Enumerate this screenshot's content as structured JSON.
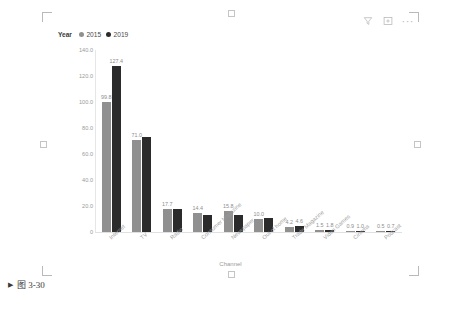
{
  "caption": {
    "marker": "▶",
    "text": "图 3-30"
  },
  "visual_header": {
    "filter_icon": "filter-funnel-icon",
    "focus_icon": "focus-mode-icon",
    "more_options": "···"
  },
  "legend": {
    "title": "Year",
    "items": [
      {
        "label": "2015",
        "color": "#909090"
      },
      {
        "label": "2019",
        "color": "#2b2b2b"
      }
    ]
  },
  "chart_data": {
    "type": "bar",
    "title": "",
    "xlabel": "Channel",
    "ylabel": "",
    "ylim": [
      0,
      140
    ],
    "yticks": [
      "0",
      "20.0",
      "40.0",
      "60.0",
      "80.0",
      "100.0",
      "120.0",
      "140.0"
    ],
    "ytick_values": [
      0,
      20,
      40,
      60,
      80,
      100,
      120,
      140
    ],
    "grid": false,
    "legend_position": "top-left",
    "categories": [
      "Internet",
      "TV",
      "Radio",
      "Consumer Magazine",
      "Newspaper",
      "Out of home",
      "Trade Magazine",
      "Video Games",
      "Cinema",
      "Podcast"
    ],
    "series": [
      {
        "name": "2015",
        "color": "#909090",
        "values": [
          99.8,
          71.0,
          17.7,
          14.4,
          15.8,
          10.0,
          4.2,
          1.5,
          0.9,
          0.5
        ],
        "labels": [
          "99.8",
          "71.0",
          "17.7",
          "14.4",
          "15.8",
          "10.0",
          "4.2",
          "1.5",
          "0.9",
          "0.5"
        ],
        "labels_visible": [
          true,
          true,
          true,
          true,
          true,
          true,
          true,
          true,
          true,
          true
        ]
      },
      {
        "name": "2019",
        "color": "#2b2b2b",
        "values": [
          127.4,
          73.0,
          17.5,
          13.0,
          13.0,
          10.5,
          4.6,
          1.8,
          1.0,
          0.7
        ],
        "labels": [
          "127.4",
          "",
          "",
          "",
          "",
          "",
          "4.6",
          "1.8",
          "1.0",
          "0.7"
        ],
        "labels_visible": [
          true,
          false,
          false,
          false,
          false,
          false,
          true,
          true,
          true,
          true
        ]
      }
    ]
  }
}
